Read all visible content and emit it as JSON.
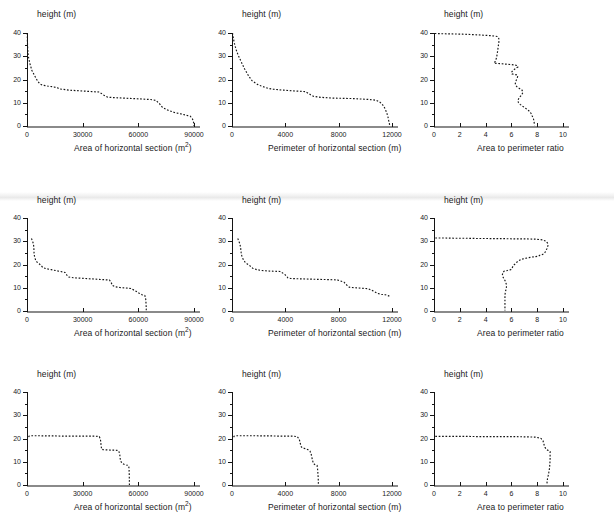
{
  "figure": {
    "rows": 3,
    "cols": 3,
    "background": "#ffffff",
    "curve_color": "#161616",
    "axis_color": "#141414",
    "xaxis_band_color": "#8a8a8a",
    "line_style": "dotted"
  },
  "labels": {
    "y_axis": "height (m)",
    "x_area": "Area of horizontal section  (m",
    "x_area_sup": "2",
    "x_area_tail": ")",
    "x_perimeter": "Perimeter of horizontal section (m)",
    "x_ratio": "Area to perimeter ratio"
  },
  "ticks": {
    "y_major": [
      "0",
      "10",
      "20",
      "30",
      "40"
    ],
    "y_major_values": [
      0,
      10,
      20,
      30,
      40
    ],
    "y_minor_values": [
      5,
      15,
      25,
      35
    ],
    "x_area": [
      "0",
      "30000",
      "60000",
      "90000"
    ],
    "x_area_values": [
      0,
      30000,
      60000,
      90000
    ],
    "x_perimeter": [
      "0",
      "4000",
      "8000",
      "12000"
    ],
    "x_perimeter_values": [
      0,
      4000,
      8000,
      12000
    ],
    "x_ratio": [
      "0",
      "2",
      "4",
      "6",
      "8",
      "10"
    ],
    "x_ratio_values": [
      0,
      2,
      4,
      6,
      8,
      10
    ]
  },
  "chart_data": [
    {
      "id": "r1c1",
      "type": "line",
      "title": "",
      "xlabel": "Area of horizontal section  (m2)",
      "ylabel": "height (m)",
      "xlim": [
        0,
        90000
      ],
      "ylim": [
        0,
        40
      ],
      "grid": false,
      "legend": "none",
      "x": [
        150,
        160,
        200,
        260,
        380,
        700,
        1500,
        2600,
        4200,
        5600,
        6800,
        8200,
        11000,
        14500,
        16500,
        17200,
        19000,
        23000,
        27000,
        31000,
        35000,
        39000,
        41500,
        43000,
        43500,
        47000,
        52000,
        57000,
        62000,
        66500,
        69500,
        71500,
        73000,
        76000,
        79500,
        83000,
        86000,
        88000,
        89200,
        89800,
        90000
      ],
      "y": [
        40,
        39,
        37.5,
        35.5,
        33,
        30,
        27,
        24,
        21.5,
        19.5,
        18.2,
        17.6,
        17.2,
        16.8,
        16.4,
        16.0,
        15.8,
        15.4,
        15.2,
        15.0,
        14.8,
        14.6,
        13.2,
        12.6,
        12.4,
        12.2,
        12.0,
        11.8,
        11.6,
        11.4,
        11.0,
        9.5,
        8.0,
        6.8,
        5.8,
        5.2,
        4.6,
        4.2,
        3.0,
        1.5,
        0
      ]
    },
    {
      "id": "r1c2",
      "type": "line",
      "title": "",
      "xlabel": "Perimeter of horizontal section (m)",
      "ylabel": "height (m)",
      "xlim": [
        0,
        12000
      ],
      "ylim": [
        0,
        40
      ],
      "grid": false,
      "legend": "none",
      "x": [
        40,
        60,
        110,
        180,
        300,
        460,
        700,
        950,
        1250,
        1500,
        1750,
        1950,
        2150,
        2400,
        2700,
        3100,
        3500,
        3900,
        4300,
        4900,
        5500,
        5900,
        6100,
        6500,
        7000,
        7600,
        8300,
        9000,
        9700,
        10300,
        10800,
        11100,
        11350,
        11500,
        11620,
        11700,
        11750,
        11800,
        11830
      ],
      "y": [
        40,
        39,
        37.5,
        35.5,
        33,
        30.5,
        27.5,
        24.5,
        21.5,
        19.5,
        18.5,
        17.8,
        17.3,
        16.8,
        16.2,
        15.8,
        15.6,
        15.4,
        15.2,
        15.0,
        14.8,
        13.4,
        12.8,
        12.4,
        12.2,
        12.0,
        11.9,
        11.8,
        11.6,
        11.4,
        11.1,
        10.2,
        8.8,
        7.2,
        5.4,
        3.8,
        2.4,
        1.2,
        0
      ]
    },
    {
      "id": "r1c3",
      "type": "line",
      "title": "",
      "xlabel": "Area to perimeter ratio",
      "ylabel": "height (m)",
      "xlim": [
        0,
        10
      ],
      "ylim": [
        0,
        40
      ],
      "grid": false,
      "legend": "none",
      "x": [
        0.05,
        0.6,
        1.4,
        2.2,
        3.0,
        3.7,
        4.3,
        4.7,
        4.9,
        5.0,
        5.05,
        5.0,
        4.95,
        4.9,
        4.85,
        4.8,
        4.75,
        4.7,
        4.65,
        5.2,
        5.6,
        6.0,
        6.3,
        6.45,
        6.5,
        6.3,
        6.1,
        6.0,
        6.05,
        6.2,
        6.4,
        6.5,
        6.45,
        6.35,
        6.3,
        6.4,
        6.6,
        6.8,
        6.9,
        6.8,
        6.6,
        6.5,
        6.55,
        6.7,
        6.9,
        7.1,
        7.3,
        7.45,
        7.55,
        7.6,
        7.7,
        7.75,
        7.8
      ],
      "y": [
        39.8,
        39.7,
        39.6,
        39.5,
        39.3,
        39.1,
        38.9,
        38.7,
        38.5,
        38.0,
        37.0,
        35.0,
        33.0,
        31.0,
        29.5,
        28.5,
        27.8,
        27.3,
        27.0,
        26.8,
        26.6,
        26.4,
        26.2,
        26.0,
        25.4,
        24.6,
        23.8,
        23.0,
        22.4,
        22.2,
        22.0,
        21.6,
        20.6,
        19.4,
        18.2,
        17.0,
        16.2,
        15.6,
        14.6,
        13.4,
        12.2,
        11.0,
        10.0,
        9.2,
        8.4,
        7.6,
        6.8,
        6.0,
        5.2,
        4.4,
        3.4,
        2.0,
        0.3
      ]
    },
    {
      "id": "r2c1",
      "type": "line",
      "title": "",
      "xlabel": "Area of horizontal section  (m2)",
      "ylabel": "height (m)",
      "xlim": [
        0,
        90000
      ],
      "ylim": [
        0,
        40
      ],
      "grid": false,
      "legend": "none",
      "x": [
        2400,
        2600,
        3000,
        3400,
        3600,
        3700,
        3750,
        3800,
        3900,
        4200,
        4600,
        5400,
        6500,
        7600,
        8600,
        10500,
        13000,
        15500,
        18000,
        20500,
        21500,
        22500,
        25000,
        29000,
        33000,
        37000,
        41000,
        44500,
        45500,
        46000,
        47500,
        50000,
        53000,
        56000,
        58500,
        60500,
        62000,
        63500,
        64000,
        64200,
        64300
      ],
      "y": [
        31.2,
        30.8,
        30.0,
        29.0,
        28.0,
        27.0,
        26.0,
        25.0,
        24.0,
        23.0,
        22.0,
        21.0,
        20.3,
        19.6,
        18.6,
        18.2,
        17.8,
        17.4,
        17.0,
        16.6,
        15.4,
        14.6,
        14.3,
        14.1,
        13.9,
        13.7,
        13.5,
        13.3,
        12.0,
        11.0,
        10.4,
        10.1,
        9.9,
        9.7,
        8.6,
        7.6,
        7.0,
        6.7,
        5.0,
        2.5,
        0
      ]
    },
    {
      "id": "r2c2",
      "type": "line",
      "title": "",
      "xlabel": "Perimeter of horizontal section (m)",
      "ylabel": "height (m)",
      "xlim": [
        0,
        12000
      ],
      "ylim": [
        0,
        40
      ],
      "grid": false,
      "legend": "none",
      "x": [
        430,
        460,
        520,
        580,
        620,
        650,
        670,
        690,
        720,
        780,
        860,
        980,
        1150,
        1350,
        1550,
        1850,
        2250,
        2700,
        3150,
        3600,
        3900,
        4100,
        4200,
        4400,
        4800,
        5300,
        5900,
        6500,
        7200,
        7900,
        8400,
        8600,
        8800,
        9200,
        9700,
        10200,
        10600,
        10900,
        11200,
        11500,
        11700,
        11800
      ],
      "y": [
        31.2,
        30.8,
        30.0,
        29.0,
        28.0,
        27.0,
        26.0,
        25.0,
        24.0,
        23.0,
        22.0,
        21.0,
        20.2,
        19.4,
        18.4,
        17.8,
        17.4,
        17.2,
        17.1,
        17.0,
        16.0,
        15.0,
        14.2,
        14.0,
        13.9,
        13.8,
        13.7,
        13.6,
        13.5,
        13.4,
        12.4,
        11.2,
        10.2,
        10.0,
        9.8,
        9.6,
        8.6,
        7.6,
        7.2,
        7.0,
        6.6,
        6.4
      ]
    },
    {
      "id": "r2c3",
      "type": "line",
      "title": "",
      "xlabel": "Area to perimeter ratio",
      "ylabel": "height (m)",
      "xlim": [
        0,
        10
      ],
      "ylim": [
        0,
        40
      ],
      "grid": false,
      "legend": "none",
      "x": [
        0.1,
        0.8,
        1.6,
        2.4,
        3.2,
        4.0,
        4.8,
        5.6,
        6.4,
        7.2,
        7.9,
        8.4,
        8.7,
        8.8,
        8.85,
        8.8,
        8.75,
        8.7,
        8.65,
        8.6,
        8.5,
        8.35,
        8.2,
        8.1,
        7.6,
        7.2,
        6.9,
        6.7,
        6.5,
        6.35,
        6.2,
        6.1,
        6.05,
        5.95,
        5.7,
        5.45,
        5.35,
        5.3,
        5.35,
        5.45,
        5.55,
        5.6,
        5.62,
        5.6,
        5.55,
        5.5,
        5.5,
        5.5,
        5.5,
        5.5
      ],
      "y": [
        31.4,
        31.4,
        31.3,
        31.3,
        31.2,
        31.2,
        31.1,
        31.1,
        31.0,
        31.0,
        30.9,
        30.6,
        30.0,
        29.2,
        28.4,
        27.6,
        26.8,
        26.2,
        25.6,
        25.2,
        24.6,
        24.2,
        24.0,
        23.6,
        23.2,
        22.8,
        22.4,
        22.0,
        21.4,
        20.6,
        19.8,
        19.0,
        18.4,
        17.8,
        17.4,
        17.2,
        16.6,
        15.6,
        14.6,
        13.6,
        12.6,
        11.6,
        10.6,
        9.6,
        8.6,
        7.0,
        5.0,
        3.0,
        1.5,
        0.2
      ]
    },
    {
      "id": "r3c1",
      "type": "line",
      "title": "",
      "xlabel": "Area of horizontal section  (m2)",
      "ylabel": "height (m)",
      "xlim": [
        0,
        90000
      ],
      "ylim": [
        0,
        40
      ],
      "grid": false,
      "legend": "none",
      "x": [
        900,
        1100,
        1400,
        1800,
        3000,
        6000,
        10000,
        15000,
        20000,
        25000,
        30000,
        34000,
        37000,
        39000,
        39600,
        39800,
        40000,
        40200,
        41000,
        43000,
        45000,
        47000,
        48500,
        49500,
        50000,
        50200,
        50500,
        51500,
        52500,
        53500,
        54300,
        54800,
        55000,
        55100,
        55150,
        55200
      ],
      "y": [
        20.6,
        21.0,
        21.1,
        21.2,
        21.2,
        21.2,
        21.1,
        21.1,
        21.0,
        21.0,
        21.0,
        21.0,
        21.0,
        20.8,
        19.5,
        18.0,
        16.6,
        15.4,
        15.2,
        15.1,
        15.0,
        15.0,
        14.9,
        14.6,
        13.0,
        11.5,
        10.2,
        9.2,
        8.8,
        8.6,
        8.5,
        8.2,
        7.0,
        5.0,
        2.5,
        0
      ]
    },
    {
      "id": "r3c2",
      "type": "line",
      "title": "",
      "xlabel": "Perimeter of horizontal section (m)",
      "ylabel": "height (m)",
      "xlim": [
        0,
        12000
      ],
      "ylim": [
        0,
        40
      ],
      "grid": false,
      "legend": "none",
      "x": [
        120,
        160,
        220,
        320,
        600,
        1100,
        1700,
        2400,
        3100,
        3700,
        4200,
        4600,
        4900,
        5050,
        5100,
        5150,
        5200,
        5300,
        5500,
        5700,
        5850,
        5950,
        6000,
        6050,
        6100,
        6200,
        6300,
        6380,
        6420,
        6450,
        6470,
        6480
      ],
      "y": [
        20.6,
        21.0,
        21.1,
        21.2,
        21.2,
        21.2,
        21.2,
        21.1,
        21.1,
        21.0,
        21.0,
        21.0,
        20.8,
        19.6,
        18.4,
        17.2,
        16.4,
        16.0,
        15.6,
        15.2,
        14.6,
        13.0,
        11.6,
        10.4,
        9.4,
        8.8,
        8.6,
        8.4,
        6.8,
        4.6,
        2.4,
        0.2
      ]
    },
    {
      "id": "r3c3",
      "type": "line",
      "title": "",
      "xlabel": "Area to perimeter ratio",
      "ylabel": "height (m)",
      "xlim": [
        0,
        10
      ],
      "ylim": [
        0,
        40
      ],
      "grid": false,
      "legend": "none",
      "x": [
        0.1,
        0.9,
        1.8,
        2.7,
        3.6,
        4.5,
        5.4,
        6.3,
        7.2,
        7.9,
        8.3,
        8.45,
        8.5,
        8.55,
        8.6,
        8.7,
        8.8,
        8.9,
        8.95,
        9.0,
        9.0,
        9.0,
        8.98,
        8.95,
        8.9,
        8.85,
        8.8,
        8.78,
        8.76,
        8.75
      ],
      "y": [
        20.9,
        20.9,
        20.9,
        20.9,
        20.8,
        20.8,
        20.8,
        20.8,
        20.7,
        20.6,
        20.0,
        19.0,
        18.0,
        17.0,
        16.2,
        15.4,
        15.0,
        14.8,
        14.6,
        14.4,
        13.0,
        11.0,
        9.0,
        7.0,
        5.4,
        4.0,
        2.8,
        1.8,
        0.9,
        0.2
      ]
    }
  ]
}
